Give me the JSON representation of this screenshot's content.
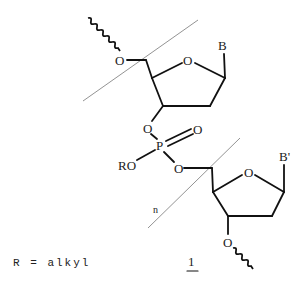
{
  "diagram": {
    "type": "chemical-structure",
    "atoms": {
      "top_o5": "O",
      "top_ring_o": "O",
      "top_base": "B",
      "o3_link": "O",
      "phosphorus": "P",
      "p_double_o": "O",
      "ro_group": "RO",
      "o5_link": "O",
      "bottom_ring_o": "O",
      "bottom_base": "B'",
      "bottom_o3": "O"
    },
    "repeat_subscript": "n",
    "compound_number": "1",
    "legend": "R = alkyl",
    "colors": {
      "bond": "#111111",
      "bracket_line": "#777777",
      "background": "#ffffff"
    }
  }
}
